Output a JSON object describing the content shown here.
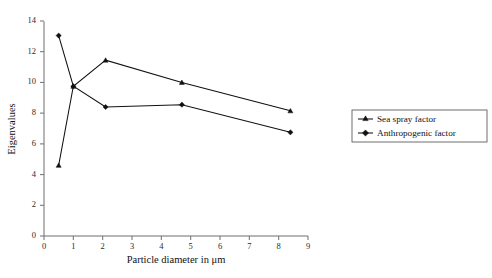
{
  "chart_data": {
    "type": "line",
    "title": "",
    "xlabel": "Particle diameter in μm",
    "ylabel": "Eigenvalues",
    "xlim": [
      0,
      9
    ],
    "ylim": [
      0,
      14
    ],
    "xticks": [
      0,
      1,
      2,
      3,
      4,
      5,
      6,
      7,
      8,
      9
    ],
    "yticks": [
      0,
      2,
      4,
      6,
      8,
      10,
      12,
      14
    ],
    "grid": false,
    "legend_position": "right",
    "series": [
      {
        "name": "Sea spray factor",
        "marker": "triangle",
        "x": [
          0.5,
          1.0,
          2.1,
          4.7,
          8.4
        ],
        "values": [
          4.6,
          9.75,
          11.45,
          10.0,
          8.15
        ]
      },
      {
        "name": "Anthropogenic  factor",
        "marker": "diamond",
        "x": [
          0.5,
          1.0,
          2.1,
          4.7,
          8.4
        ],
        "values": [
          13.05,
          9.75,
          8.4,
          8.55,
          6.75
        ]
      }
    ]
  },
  "axes": {
    "y_title": "Eigenvalues",
    "x_title": "Particle diameter in μm",
    "y_tick_labels": [
      "0",
      "2",
      "4",
      "6",
      "8",
      "10",
      "12",
      "14"
    ],
    "x_tick_labels": [
      "0",
      "1",
      "2",
      "3",
      "4",
      "5",
      "6",
      "7",
      "8",
      "9"
    ]
  },
  "legend": {
    "items": [
      {
        "label": "Sea spray factor"
      },
      {
        "label": "Anthropogenic  factor"
      }
    ]
  },
  "colors": {
    "line": "#111111",
    "axis": "#6f6f6f",
    "legend_border": "#5e5e5e",
    "background": "#ffffff"
  }
}
